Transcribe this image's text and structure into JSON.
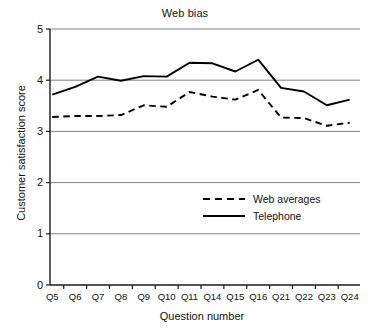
{
  "chart_data": {
    "type": "line",
    "title": "Web bias",
    "xlabel": "Question number",
    "ylabel": "Customer satisfaction score",
    "categories": [
      "Q5",
      "Q6",
      "Q7",
      "Q8",
      "Q9",
      "Q10",
      "Q11",
      "Q14",
      "Q15",
      "Q16",
      "Q21",
      "Q22",
      "Q23",
      "Q24"
    ],
    "ylim": [
      0,
      5
    ],
    "yticks": [
      0,
      1,
      2,
      3,
      4,
      5
    ],
    "ytick_labels": [
      "0",
      "1",
      "2",
      "3",
      "4",
      "5"
    ],
    "grid": "horizontal",
    "legend_position": "center-right",
    "series": [
      {
        "name": "Web averages",
        "style": "dashed",
        "color": "#000000",
        "values": [
          3.28,
          3.3,
          3.3,
          3.32,
          3.51,
          3.48,
          3.77,
          3.68,
          3.62,
          3.81,
          3.27,
          3.26,
          3.11,
          3.17
        ]
      },
      {
        "name": "Telephone",
        "style": "solid",
        "color": "#000000",
        "values": [
          3.72,
          3.87,
          4.07,
          3.99,
          4.08,
          4.07,
          4.34,
          4.33,
          4.17,
          4.4,
          3.85,
          3.78,
          3.51,
          3.62
        ]
      }
    ]
  },
  "axes": {
    "gridline_color": "#808080",
    "axis_color": "#1a1a1a"
  },
  "legend": {
    "items": [
      {
        "label": "Web averages",
        "style": "dashed"
      },
      {
        "label": "Telephone",
        "style": "solid"
      }
    ]
  }
}
